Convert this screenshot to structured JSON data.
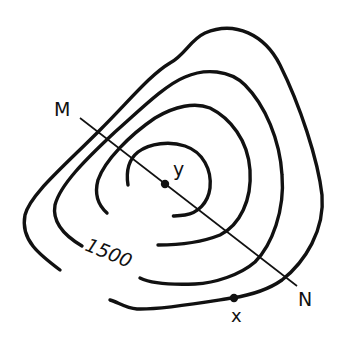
{
  "diagram": {
    "type": "topographic-contour-map",
    "contour_label": "1500",
    "points": {
      "M": "M",
      "N": "N",
      "x": "x",
      "y": "y"
    },
    "colors": {
      "ink": "#111111",
      "background": "#ffffff"
    }
  }
}
